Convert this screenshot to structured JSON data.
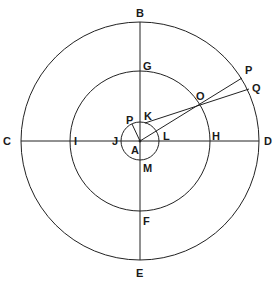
{
  "diagram": {
    "center": {
      "x": 140,
      "y": 141
    },
    "circles": [
      {
        "name": "outer-circle",
        "r": 119
      },
      {
        "name": "middle-circle",
        "r": 70
      },
      {
        "name": "inner-circle",
        "r": 19
      }
    ],
    "labels": {
      "B": "B",
      "C": "C",
      "D": "D",
      "E": "E",
      "G": "G",
      "I": "I",
      "H": "H",
      "F": "F",
      "J": "J",
      "K": "K",
      "L": "L",
      "M": "M",
      "A": "A",
      "P_inner": "P",
      "O": "O",
      "P_outer": "P",
      "Q": "Q"
    },
    "colors": {
      "line": "#222222",
      "text": "#1a1a1a",
      "background": "#ffffff"
    }
  }
}
